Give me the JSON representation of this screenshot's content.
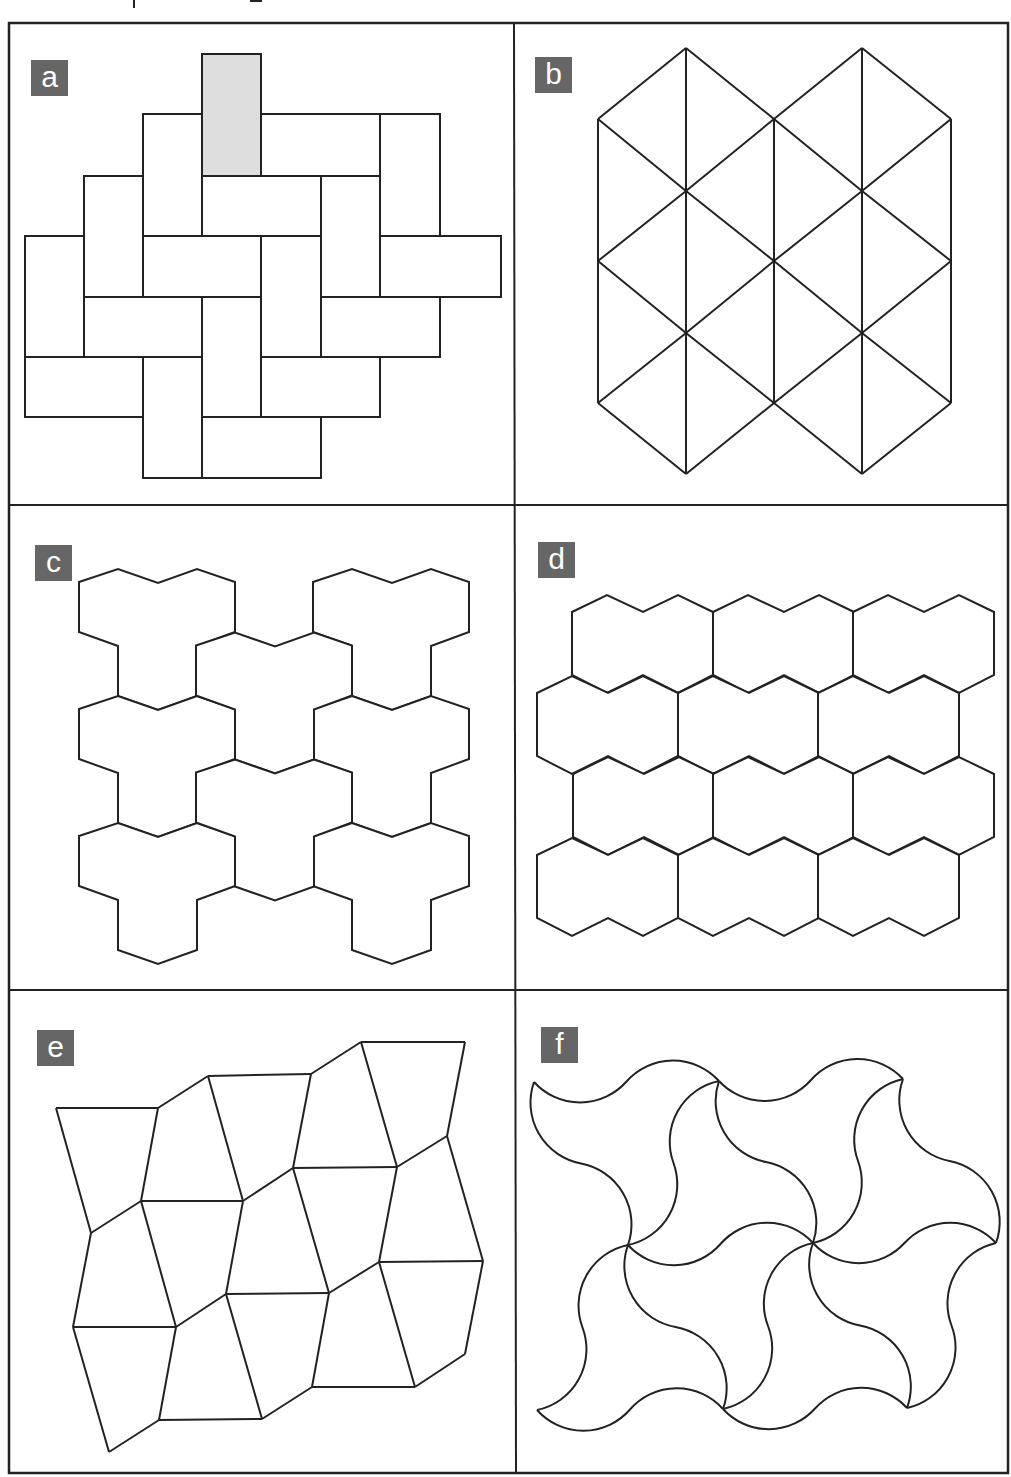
{
  "colors": {
    "stroke": "#222222",
    "label_bg": "#666666",
    "label_fg": "#ffffff",
    "highlight_fill": "#dedede",
    "tile_fill": "#ffffff"
  },
  "frame": {
    "outer": {
      "x": 9,
      "y": 23,
      "w": 999,
      "h": 1450
    },
    "dividers": [
      {
        "x1": 514,
        "y1": 23,
        "x2": 516,
        "y2": 1473
      },
      {
        "x1": 9,
        "y1": 505,
        "x2": 1008,
        "y2": 505
      },
      {
        "x1": 9,
        "y1": 990,
        "x2": 1008,
        "y2": 990
      }
    ]
  },
  "caption_fragments": [
    {
      "x": 133,
      "y": 0,
      "w": 2,
      "h": 8
    },
    {
      "x": 250,
      "y": 0,
      "w": 12,
      "h": 2
    }
  ],
  "panels": [
    {
      "id": "a",
      "label": "a",
      "label_pos": {
        "x": 31,
        "y": 60
      },
      "kind": "rects",
      "rects": [
        {
          "x": 202,
          "y": 54,
          "w": 59,
          "h": 122,
          "highlight": true
        },
        {
          "x": 143,
          "y": 114,
          "w": 59,
          "h": 122
        },
        {
          "x": 261,
          "y": 114,
          "w": 119,
          "h": 62
        },
        {
          "x": 380,
          "y": 114,
          "w": 60,
          "h": 122
        },
        {
          "x": 84,
          "y": 176,
          "w": 59,
          "h": 121
        },
        {
          "x": 202,
          "y": 176,
          "w": 119,
          "h": 60
        },
        {
          "x": 321,
          "y": 176,
          "w": 59,
          "h": 121
        },
        {
          "x": 25,
          "y": 236,
          "w": 59,
          "h": 121
        },
        {
          "x": 143,
          "y": 236,
          "w": 118,
          "h": 61
        },
        {
          "x": 261,
          "y": 236,
          "w": 60,
          "h": 121
        },
        {
          "x": 380,
          "y": 236,
          "w": 121,
          "h": 61
        },
        {
          "x": 84,
          "y": 297,
          "w": 118,
          "h": 60
        },
        {
          "x": 202,
          "y": 297,
          "w": 59,
          "h": 120
        },
        {
          "x": 321,
          "y": 297,
          "w": 119,
          "h": 60
        },
        {
          "x": 25,
          "y": 357,
          "w": 118,
          "h": 60
        },
        {
          "x": 143,
          "y": 357,
          "w": 59,
          "h": 121
        },
        {
          "x": 261,
          "y": 357,
          "w": 119,
          "h": 60
        },
        {
          "x": 202,
          "y": 417,
          "w": 119,
          "h": 61
        }
      ]
    },
    {
      "id": "b",
      "label": "b",
      "label_pos": {
        "x": 535,
        "y": 57
      },
      "kind": "segments",
      "segments": [
        [
          598,
          119,
          598,
          403
        ],
        [
          686,
          48,
          686,
          474
        ],
        [
          774,
          119,
          774,
          403
        ],
        [
          862,
          48,
          862,
          474
        ],
        [
          951,
          119,
          951,
          403
        ],
        [
          686,
          48,
          598,
          119
        ],
        [
          686,
          48,
          774,
          119
        ],
        [
          862,
          48,
          774,
          119
        ],
        [
          862,
          48,
          951,
          119
        ],
        [
          598,
          119,
          686,
          191
        ],
        [
          774,
          119,
          686,
          191
        ],
        [
          774,
          119,
          862,
          191
        ],
        [
          951,
          119,
          862,
          191
        ],
        [
          686,
          191,
          598,
          261
        ],
        [
          686,
          191,
          774,
          261
        ],
        [
          862,
          191,
          774,
          261
        ],
        [
          862,
          191,
          951,
          261
        ],
        [
          598,
          261,
          686,
          333
        ],
        [
          774,
          261,
          686,
          333
        ],
        [
          774,
          261,
          862,
          333
        ],
        [
          951,
          261,
          862,
          333
        ],
        [
          686,
          333,
          598,
          403
        ],
        [
          686,
          333,
          774,
          403
        ],
        [
          862,
          333,
          774,
          403
        ],
        [
          862,
          333,
          951,
          403
        ],
        [
          598,
          403,
          686,
          474
        ],
        [
          774,
          403,
          686,
          474
        ],
        [
          774,
          403,
          862,
          474
        ],
        [
          951,
          403,
          862,
          474
        ]
      ]
    },
    {
      "id": "c",
      "label": "c",
      "label_pos": {
        "x": 35,
        "y": 545
      },
      "kind": "tiles",
      "origin": {
        "x": 79,
        "y": 569
      },
      "tile": [
        [
          0,
          13
        ],
        [
          39,
          0
        ],
        [
          79,
          14
        ],
        [
          118,
          0
        ],
        [
          156,
          13
        ],
        [
          156,
          63
        ],
        [
          118,
          77
        ],
        [
          118,
          127
        ],
        [
          79,
          141
        ],
        [
          39,
          127
        ],
        [
          39,
          77
        ],
        [
          0,
          63
        ]
      ],
      "offsets": [
        [
          0,
          0
        ],
        [
          0,
          127
        ],
        [
          0,
          254
        ],
        [
          234,
          0
        ],
        [
          234,
          127
        ],
        [
          234,
          254
        ],
        [
          117,
          63.5
        ],
        [
          117,
          190.5
        ]
      ]
    },
    {
      "id": "d",
      "label": "d",
      "label_pos": {
        "x": 538,
        "y": 542
      },
      "kind": "tiles",
      "origin": {
        "x": 0,
        "y": 0
      },
      "tile": [
        [
          0,
          17
        ],
        [
          35,
          0
        ],
        [
          71,
          17
        ],
        [
          106,
          0
        ],
        [
          141,
          17
        ],
        [
          141,
          80
        ],
        [
          106,
          98
        ],
        [
          71,
          80
        ],
        [
          35,
          98
        ],
        [
          0,
          80
        ]
      ],
      "offsets": [
        [
          572,
          595
        ],
        [
          713,
          595
        ],
        [
          853,
          595
        ],
        [
          537,
          676
        ],
        [
          678,
          676
        ],
        [
          818,
          676
        ],
        [
          573,
          757
        ],
        [
          713,
          757
        ],
        [
          853,
          757
        ],
        [
          537,
          838
        ],
        [
          678,
          838
        ],
        [
          818,
          838
        ]
      ]
    },
    {
      "id": "e",
      "label": "e",
      "label_pos": {
        "x": 37,
        "y": 1030
      },
      "kind": "graph",
      "vertices": {
        "A": [
          56,
          1108
        ],
        "B": [
          158,
          1108
        ],
        "C": [
          208,
          1076
        ],
        "D": [
          311,
          1074
        ],
        "E": [
          361,
          1042
        ],
        "F": [
          465,
          1042
        ],
        "G": [
          91,
          1233
        ],
        "H": [
          141,
          1201
        ],
        "I": [
          243,
          1201
        ],
        "J": [
          293,
          1168
        ],
        "K": [
          397,
          1167
        ],
        "L": [
          447,
          1136
        ],
        "M": [
          73,
          1327
        ],
        "N": [
          176,
          1327
        ],
        "O": [
          226,
          1294
        ],
        "P": [
          329,
          1293
        ],
        "Q": [
          379,
          1262
        ],
        "R": [
          483,
          1261
        ],
        "S": [
          109,
          1452
        ],
        "T": [
          159,
          1420
        ],
        "U": [
          262,
          1419
        ],
        "V": [
          312,
          1387
        ],
        "W": [
          415,
          1387
        ],
        "X": [
          465,
          1354
        ]
      },
      "edges": [
        [
          "A",
          "B"
        ],
        [
          "B",
          "C"
        ],
        [
          "C",
          "D"
        ],
        [
          "D",
          "E"
        ],
        [
          "E",
          "F"
        ],
        [
          "A",
          "G"
        ],
        [
          "B",
          "H"
        ],
        [
          "C",
          "I"
        ],
        [
          "D",
          "J"
        ],
        [
          "E",
          "K"
        ],
        [
          "F",
          "L"
        ],
        [
          "G",
          "H"
        ],
        [
          "H",
          "I"
        ],
        [
          "I",
          "J"
        ],
        [
          "J",
          "K"
        ],
        [
          "K",
          "L"
        ],
        [
          "G",
          "M"
        ],
        [
          "H",
          "N"
        ],
        [
          "I",
          "O"
        ],
        [
          "J",
          "P"
        ],
        [
          "K",
          "Q"
        ],
        [
          "L",
          "R"
        ],
        [
          "M",
          "N"
        ],
        [
          "N",
          "O"
        ],
        [
          "O",
          "P"
        ],
        [
          "P",
          "Q"
        ],
        [
          "Q",
          "R"
        ],
        [
          "M",
          "S"
        ],
        [
          "N",
          "T"
        ],
        [
          "O",
          "U"
        ],
        [
          "P",
          "V"
        ],
        [
          "Q",
          "W"
        ],
        [
          "R",
          "X"
        ],
        [
          "S",
          "T"
        ],
        [
          "T",
          "U"
        ],
        [
          "U",
          "V"
        ],
        [
          "V",
          "W"
        ],
        [
          "W",
          "X"
        ]
      ]
    },
    {
      "id": "f",
      "label": "f",
      "label_pos": {
        "x": 541,
        "y": 1027
      },
      "kind": "curves",
      "arc_radius": 62,
      "vertices": {
        "V1": [
          534,
          1082
        ],
        "V2": [
          719,
          1081
        ],
        "V3": [
          903,
          1079
        ],
        "V4": [
          628,
          1245
        ],
        "V5": [
          813,
          1243
        ],
        "V6": [
          996,
          1243
        ],
        "V7": [
          537,
          1410
        ],
        "V8": [
          723,
          1409
        ],
        "V9": [
          907,
          1408
        ]
      },
      "edges": [
        [
          "V1",
          "V2"
        ],
        [
          "V2",
          "V3"
        ],
        [
          "V4",
          "V5"
        ],
        [
          "V5",
          "V6"
        ],
        [
          "V7",
          "V8"
        ],
        [
          "V8",
          "V9"
        ],
        [
          "V1",
          "V4"
        ],
        [
          "V2",
          "V4"
        ],
        [
          "V2",
          "V5"
        ],
        [
          "V3",
          "V5"
        ],
        [
          "V3",
          "V6"
        ],
        [
          "V4",
          "V7"
        ],
        [
          "V4",
          "V8"
        ],
        [
          "V5",
          "V8"
        ],
        [
          "V5",
          "V9"
        ],
        [
          "V6",
          "V9"
        ]
      ]
    }
  ]
}
